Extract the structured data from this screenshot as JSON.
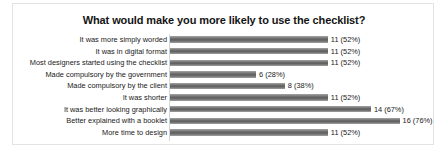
{
  "chart_data": {
    "type": "bar",
    "orientation": "horizontal",
    "title": "What would make you more likely to use the checklist?",
    "xlabel": "",
    "ylabel": "",
    "xlim": [
      0,
      21
    ],
    "grid": false,
    "legend": false,
    "total_respondents": 21,
    "categories": [
      "It was more simply worded",
      "It was in digital format",
      "Most designers started using the checklist",
      "Made compulsory by the government",
      "Made compulsory by the client",
      "It was shorter",
      "It was better looking graphically",
      "Better explained with a booklet",
      "More time to design"
    ],
    "values": [
      11,
      11,
      11,
      6,
      8,
      11,
      14,
      16,
      11
    ],
    "percents": [
      52,
      52,
      52,
      28,
      38,
      52,
      67,
      76,
      52
    ],
    "data_labels": [
      "11 (52%)",
      "11 (52%)",
      "11 (52%)",
      "6 (28%)",
      "8 (38%)",
      "11 (52%)",
      "14 (67%)",
      "16 (76%)",
      "11 (52%)"
    ],
    "bar_color": "#6d6d6d",
    "background_color": "#ffffff",
    "frame_color": "#e3e3e3"
  }
}
